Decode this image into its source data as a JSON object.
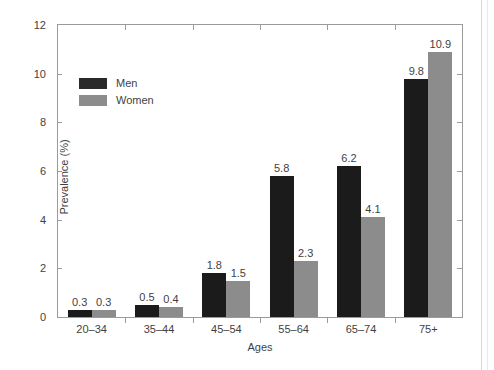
{
  "chart_data": {
    "type": "bar",
    "title": "",
    "subtitle": "",
    "xlabel": "Ages",
    "ylabel": "Prevalence (%)",
    "categories": [
      "20–34",
      "35–44",
      "45–54",
      "55–64",
      "65–74",
      "75+"
    ],
    "series": [
      {
        "name": "Men",
        "color": "#1b1b1b",
        "values": [
          0.3,
          0.5,
          1.8,
          5.8,
          6.2,
          9.8
        ]
      },
      {
        "name": "Women",
        "color": "#8c8c8c",
        "values": [
          0.3,
          0.4,
          1.5,
          2.3,
          4.1,
          10.9
        ]
      }
    ],
    "data_labels": [
      [
        "0.3",
        "0.3"
      ],
      [
        "0.5",
        "0.4"
      ],
      [
        "1.8",
        "1.5"
      ],
      [
        "5.8",
        "2.3"
      ],
      [
        "6.2",
        "4.1"
      ],
      [
        "9.8",
        "10.9"
      ]
    ],
    "ylim": [
      0,
      12
    ],
    "yticks": [
      0,
      2,
      4,
      6,
      8,
      10,
      12
    ],
    "ytick_labels": [
      "0",
      "2",
      "4",
      "6",
      "8",
      "10",
      "12"
    ],
    "grid": false,
    "legend_position": "upper-left-inside",
    "legend_entries": [
      "Men",
      "Women"
    ],
    "axis_box": true
  },
  "legend": {
    "items": [
      {
        "label": "Men",
        "swatch": "men"
      },
      {
        "label": "Women",
        "swatch": "women"
      }
    ]
  },
  "axes": {
    "y_title": "Prevalence (%)",
    "x_title": "Ages"
  }
}
